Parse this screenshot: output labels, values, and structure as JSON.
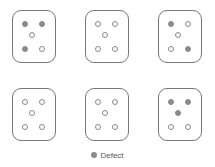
{
  "colors": {
    "defect": "#8a8a8a",
    "ok_outline": "#888888",
    "card_border": "#777777"
  },
  "layout": {
    "card_positions": [
      [
        12,
        10
      ],
      [
        85,
        10
      ],
      [
        158,
        10
      ],
      [
        12,
        88
      ],
      [
        85,
        88
      ],
      [
        158,
        88
      ]
    ],
    "dot_slots": [
      "top-left",
      "top-right",
      "center",
      "bottom-left",
      "bottom-right"
    ],
    "dot_offsets": [
      [
        9,
        10
      ],
      [
        26,
        10
      ],
      [
        16,
        21
      ],
      [
        9,
        35
      ],
      [
        26,
        35
      ]
    ]
  },
  "cards": [
    {
      "id": 1,
      "dots": [
        "defect",
        "defect",
        "ok",
        "defect",
        "ok"
      ]
    },
    {
      "id": 2,
      "dots": [
        "ok",
        "ok",
        "ok",
        "ok",
        "ok"
      ]
    },
    {
      "id": 3,
      "dots": [
        "defect",
        "ok",
        "ok",
        "ok",
        "defect"
      ]
    },
    {
      "id": 4,
      "dots": [
        "ok",
        "ok",
        "ok",
        "ok",
        "ok"
      ]
    },
    {
      "id": 5,
      "dots": [
        "ok",
        "ok",
        "ok",
        "ok",
        "ok"
      ]
    },
    {
      "id": 6,
      "dots": [
        "defect",
        "defect",
        "defect",
        "ok",
        "ok"
      ]
    }
  ],
  "legend": {
    "label": "Defect",
    "icon": "filled-circle-icon"
  }
}
